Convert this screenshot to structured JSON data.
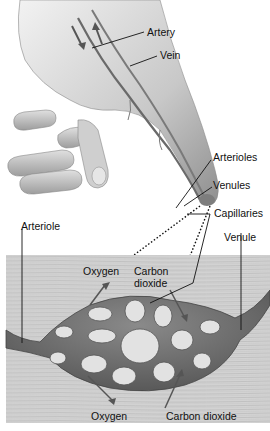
{
  "diagram": {
    "labels": {
      "artery": "Artery",
      "vein": "Vein",
      "arterioles": "Arterioles",
      "venules": "Venules",
      "capillaries": "Capillaries",
      "arteriole": "Arteriole",
      "venule": "Venule",
      "oxygen_top": "Oxygen",
      "carbon_dioxide_top_line1": "Carbon",
      "carbon_dioxide_top_line2": "dioxide",
      "oxygen_bottom": "Oxygen",
      "carbon_dioxide_bottom": "Carbon dioxide"
    },
    "colors": {
      "skin": "#d9d9d9",
      "skin_shadow": "#9a9a9a",
      "tissue": "#cfcfcf",
      "vessel": "#6e6e6e",
      "vessel_dark": "#4a4a4a",
      "hole": "#e4e4e4",
      "leader_line": "#111111"
    }
  }
}
